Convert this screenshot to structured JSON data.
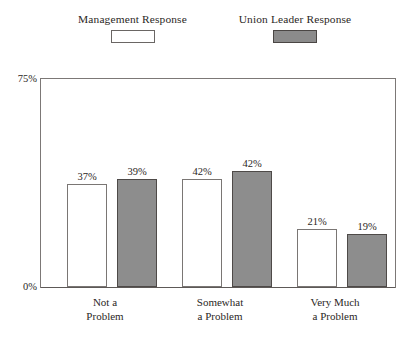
{
  "chart_data": {
    "type": "bar",
    "title": "",
    "xlabel": "",
    "ylabel": "",
    "ylim": [
      0,
      75
    ],
    "grid": false,
    "legend_position": "top",
    "y_ticks": [
      "0%",
      "75%"
    ],
    "categories": [
      {
        "lines": [
          "Not a",
          "Problem"
        ]
      },
      {
        "lines": [
          "Somewhat",
          "a Problem"
        ]
      },
      {
        "lines": [
          "Very Much",
          "a Problem"
        ]
      }
    ],
    "series": [
      {
        "name": "Management Response",
        "swatch": "open",
        "color": "#ffffff",
        "values": [
          37,
          39,
          21
        ],
        "labels": [
          "37%",
          "42%",
          "21%"
        ]
      },
      {
        "name": "Union Leader Response",
        "swatch": "filled",
        "color": "#8d8d8d",
        "values": [
          39,
          42,
          19
        ],
        "labels": [
          "39%",
          "42%",
          "19%"
        ]
      }
    ]
  },
  "legend": {
    "management": {
      "label": "Management Response"
    },
    "union": {
      "label": "Union Leader Response"
    }
  },
  "axis": {
    "y_top": "75%",
    "y_bottom": "0%"
  },
  "values": {
    "g0s0": "37%",
    "g0s1": "39%",
    "g1s0": "42%",
    "g1s1": "42%",
    "g2s0": "21%",
    "g2s1": "19%"
  },
  "categories": {
    "c0l0": "Not a",
    "c0l1": "Problem",
    "c1l0": "Somewhat",
    "c1l1": "a Problem",
    "c2l0": "Very Much",
    "c2l1": "a Problem"
  }
}
